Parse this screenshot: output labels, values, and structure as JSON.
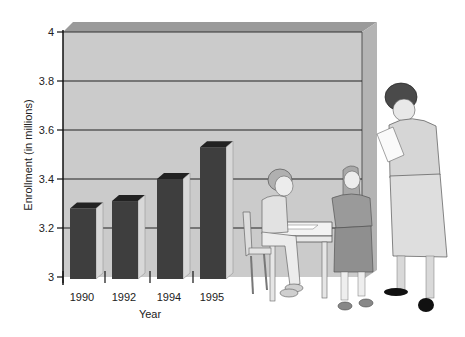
{
  "chart_data": {
    "type": "bar",
    "title": "",
    "categories": [
      "1990",
      "1992",
      "1994",
      "1995"
    ],
    "values": [
      3.28,
      3.31,
      3.4,
      3.53
    ],
    "xlabel": "Year",
    "ylabel": "Enrollment (in millions)",
    "ylim": [
      3,
      4
    ],
    "yticks": [
      "3",
      "3.2",
      "3.4",
      "3.6",
      "3.8",
      "4"
    ],
    "grid": true,
    "legend": null,
    "style": "3d",
    "illustration": "teacher reading a paper with two children at a school desk"
  },
  "colors": {
    "panel": "#c9c9c9",
    "panel_top": "#8a8a8a",
    "panel_side": "#a8a8a8",
    "bar_front": "#3e3e3e",
    "bar_top": "#222222",
    "bar_side": "#d8d8d8",
    "gridline": "#222222"
  }
}
